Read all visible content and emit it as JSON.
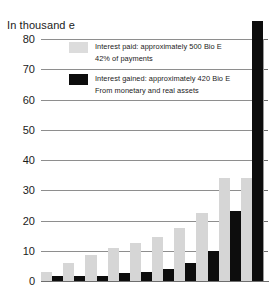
{
  "chart_data": {
    "type": "bar",
    "title": "In thousand e",
    "xlabel": "",
    "ylabel": "In thousand e",
    "ylim": [
      0,
      80
    ],
    "yticks": [
      80,
      70,
      60,
      50,
      40,
      30,
      20,
      10,
      0
    ],
    "grid": true,
    "legend_position": "inside-top-left",
    "categories": [
      "1",
      "2",
      "3",
      "4",
      "5",
      "6",
      "7",
      "8",
      "9",
      "10"
    ],
    "series": [
      {
        "name": "Interest paid: approximately 500 Bio E",
        "color": "#d6d6d6",
        "values": [
          3,
          6,
          8.5,
          11,
          12.5,
          14.5,
          17.5,
          22.5,
          34,
          34
        ]
      },
      {
        "name": "Interest gained: approximately 420 Bio E",
        "color": "#0d0d0d",
        "values": [
          1.5,
          1.5,
          1.5,
          2.5,
          3,
          4,
          6,
          10,
          23,
          86
        ]
      }
    ]
  },
  "legend": {
    "items": [
      {
        "swatch": "paid",
        "line1": "Interest paid: approximately 500 Bio E",
        "line2": "42% of payments"
      },
      {
        "swatch": "gained",
        "line1": "Interest gained: approximately 420 Bio E",
        "line2": "From monetary and real assets"
      }
    ]
  },
  "colors": {
    "paid": "#d6d6d6",
    "gained": "#0d0d0d",
    "gridline": "#8e8e8e",
    "background": "#ffffff"
  }
}
